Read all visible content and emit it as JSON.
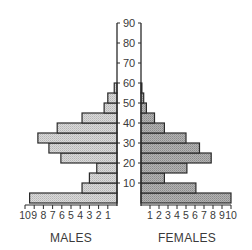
{
  "chart_data": {
    "type": "bar",
    "subtype": "population-pyramid",
    "title": "",
    "age_axis": {
      "label": "",
      "ticks": [
        10,
        20,
        30,
        40,
        50,
        60,
        70,
        80,
        90
      ],
      "range": [
        0,
        90
      ]
    },
    "categories": [
      "0-5",
      "5-10",
      "10-15",
      "15-20",
      "20-25",
      "25-30",
      "30-35",
      "35-40",
      "40-45",
      "45-50",
      "50-55",
      "55-60"
    ],
    "series": [
      {
        "name": "MALES",
        "side": "left",
        "color": "#cfcfcf",
        "values": [
          9.5,
          3.8,
          3.0,
          2.2,
          6.1,
          7.4,
          8.6,
          6.5,
          3.8,
          1.4,
          1.0,
          0.3
        ]
      },
      {
        "name": "FEMALES",
        "side": "right",
        "color": "#a9a9a9",
        "values": [
          10.0,
          6.1,
          2.6,
          5.1,
          7.8,
          6.5,
          5.0,
          2.6,
          1.5,
          0.6,
          0.3,
          0.1
        ]
      }
    ],
    "male_axis": {
      "label": "MALES",
      "ticks": [
        "10",
        "9",
        "8",
        "7",
        "6",
        "5",
        "4",
        "3",
        "2",
        "1"
      ],
      "range": [
        10,
        0
      ]
    },
    "female_axis": {
      "label": "FEMALES",
      "ticks": [
        "1",
        "2",
        "3",
        "4",
        "5",
        "6",
        "7",
        "8",
        "9",
        "10"
      ],
      "range": [
        0,
        10
      ]
    },
    "grid": false,
    "legend": "none"
  }
}
